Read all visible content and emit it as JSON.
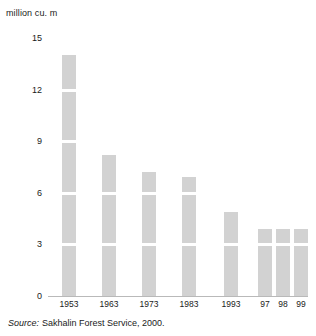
{
  "chart_data": {
    "type": "bar",
    "title": "",
    "subtitle": "",
    "ylabel": "million cu. m",
    "xlabel": "",
    "categories": [
      "1953",
      "1963",
      "1973",
      "1983",
      "1993",
      "97",
      "98",
      "99"
    ],
    "values": [
      14.0,
      8.2,
      7.2,
      6.9,
      4.9,
      3.9,
      3.9,
      3.9
    ],
    "series": [
      {
        "name": "Timber harvest",
        "values": [
          14.0,
          8.2,
          7.2,
          6.9,
          4.9,
          3.9,
          3.9,
          3.9
        ]
      }
    ],
    "ylim": [
      0,
      15
    ],
    "yticks": [
      "0",
      "3",
      "6",
      "9",
      "12",
      "15"
    ],
    "ytick_values": [
      0,
      3,
      6,
      9,
      12,
      15
    ],
    "grid": true,
    "grid_orientation": "horizontal",
    "legend": "none",
    "bar_color": "#d2d2d2",
    "axis_color": "#b9b9b9",
    "text_color": "#1a1a1a"
  },
  "source": {
    "label": "Source:",
    "text": "Sakhalin Forest Service, 2000."
  }
}
